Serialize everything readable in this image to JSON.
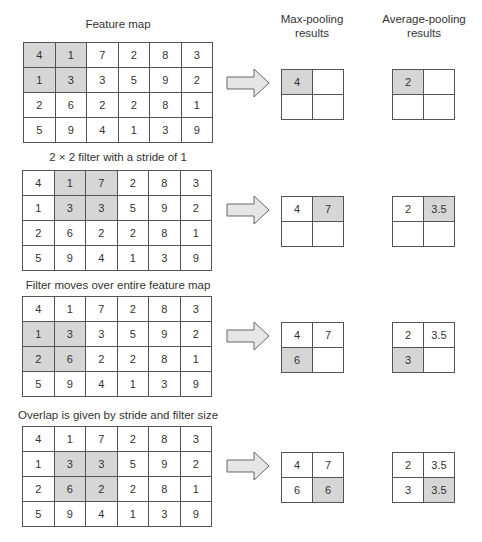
{
  "headers": {
    "feature_map": "Feature map",
    "max_pooling": [
      "Max-pooling",
      "results"
    ],
    "avg_pooling": [
      "Average-pooling",
      "results"
    ]
  },
  "colors": {
    "highlight": "#d6d6d6",
    "grid_line": "#555555",
    "arrow_fill": "#e6e6e6",
    "arrow_stroke": "#666666"
  },
  "feature_map": [
    [
      4,
      1,
      7,
      2,
      8,
      3
    ],
    [
      1,
      3,
      3,
      5,
      9,
      2
    ],
    [
      2,
      6,
      2,
      2,
      8,
      1
    ],
    [
      5,
      9,
      4,
      1,
      3,
      9
    ]
  ],
  "steps": [
    {
      "caption": "",
      "highlight_cells": [
        [
          0,
          0
        ],
        [
          0,
          1
        ],
        [
          1,
          0
        ],
        [
          1,
          1
        ]
      ],
      "max_pool": [
        [
          "4",
          ""
        ],
        [
          "",
          ""
        ]
      ],
      "avg_pool": [
        [
          "2",
          ""
        ],
        [
          "",
          ""
        ]
      ],
      "result_highlight": [
        0,
        0
      ]
    },
    {
      "caption": "2 × 2 filter with a stride of 1",
      "highlight_cells": [
        [
          0,
          1
        ],
        [
          0,
          2
        ],
        [
          1,
          1
        ],
        [
          1,
          2
        ]
      ],
      "max_pool": [
        [
          "4",
          "7"
        ],
        [
          "",
          ""
        ]
      ],
      "avg_pool": [
        [
          "2",
          "3.5"
        ],
        [
          "",
          ""
        ]
      ],
      "result_highlight": [
        0,
        1
      ]
    },
    {
      "caption": "Filter moves over entire feature map",
      "highlight_cells": [
        [
          1,
          0
        ],
        [
          1,
          1
        ],
        [
          2,
          0
        ],
        [
          2,
          1
        ]
      ],
      "max_pool": [
        [
          "4",
          "7"
        ],
        [
          "6",
          ""
        ]
      ],
      "avg_pool": [
        [
          "2",
          "3.5"
        ],
        [
          "3",
          ""
        ]
      ],
      "result_highlight": [
        1,
        0
      ]
    },
    {
      "caption": "Overlap is given by stride and filter size",
      "highlight_cells": [
        [
          1,
          1
        ],
        [
          1,
          2
        ],
        [
          2,
          1
        ],
        [
          2,
          2
        ]
      ],
      "max_pool": [
        [
          "4",
          "7"
        ],
        [
          "6",
          "6"
        ]
      ],
      "avg_pool": [
        [
          "2",
          "3.5"
        ],
        [
          "3",
          "3.5"
        ]
      ],
      "result_highlight": [
        1,
        1
      ]
    }
  ]
}
